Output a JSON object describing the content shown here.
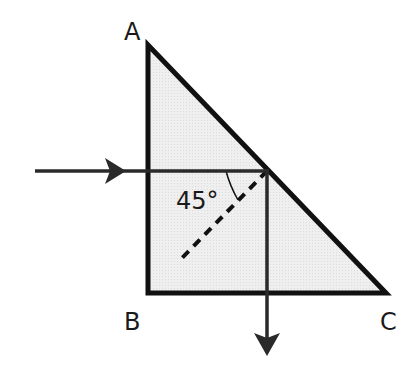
{
  "diagram": {
    "vertices": [
      {
        "label": "A",
        "x": 148,
        "y": 45
      },
      {
        "label": "B",
        "x": 148,
        "y": 293
      },
      {
        "label": "C",
        "x": 386,
        "y": 293
      }
    ],
    "angle_label": "45°",
    "colors": {
      "prism_fill": "#ececec",
      "stroke": "#1a1a1a",
      "ray": "#2a2a2a"
    }
  },
  "labels": {
    "A": "A",
    "B": "B",
    "C": "C",
    "angle": "45°"
  }
}
